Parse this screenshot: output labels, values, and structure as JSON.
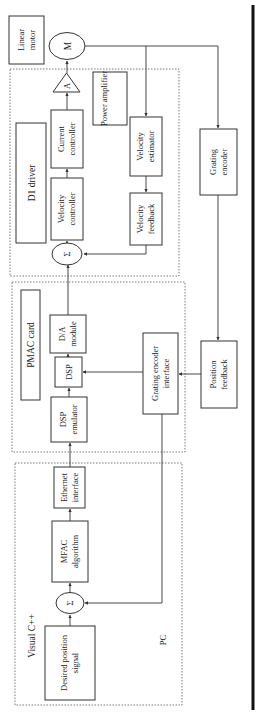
{
  "diagram": {
    "orientation": "rotated 90° counter-clockwise",
    "groups": {
      "pc": {
        "label": "PC",
        "sublabel": "Visual C++"
      },
      "pmac": {
        "label": "PMAC card"
      },
      "driver": {
        "label": "D1 driver",
        "sublabel": "Power amplifier"
      }
    },
    "blocks": {
      "desired_position": {
        "line1": "Desired position",
        "line2": "signal"
      },
      "sum_pc": {
        "symbol": "Σ"
      },
      "mfac": {
        "line1": "MFAC",
        "line2": "algorithm"
      },
      "ethernet": {
        "line1": "Ethernet",
        "line2": "interface"
      },
      "dsp_emulator": {
        "line1": "DSP",
        "line2": "emulator"
      },
      "dsp": {
        "line1": "DSP"
      },
      "da_module": {
        "line1": "D/A",
        "line2": "module"
      },
      "grating_encoder_interface": {
        "line1": "Grating encoder",
        "line2": "interface"
      },
      "sum_driver": {
        "symbol": "Σ"
      },
      "velocity_controller": {
        "line1": "Velocity",
        "line2": "controller"
      },
      "current_controller": {
        "line1": "Current",
        "line2": "controller"
      },
      "amplifier": {
        "symbol": "A"
      },
      "motor": {
        "symbol": "M"
      },
      "linear_motor": {
        "line1": "Linear",
        "line2": "motor"
      },
      "velocity_estimator": {
        "line1": "Velocity",
        "line2": "estimator"
      },
      "velocity_feedback": {
        "line1": "Velocity",
        "line2": "feedback"
      },
      "grating_encoder": {
        "line1": "Grating",
        "line2": "encoder"
      },
      "position_feedback": {
        "line1": "Position",
        "line2": "feedback"
      }
    },
    "connections": [
      [
        "desired_position",
        "sum_pc"
      ],
      [
        "sum_pc",
        "mfac"
      ],
      [
        "mfac",
        "ethernet"
      ],
      [
        "ethernet",
        "dsp_emulator"
      ],
      [
        "dsp_emulator",
        "dsp"
      ],
      [
        "dsp",
        "da_module"
      ],
      [
        "da_module",
        "sum_driver"
      ],
      [
        "sum_driver",
        "velocity_controller"
      ],
      [
        "velocity_controller",
        "current_controller"
      ],
      [
        "current_controller",
        "amplifier"
      ],
      [
        "amplifier",
        "motor"
      ],
      [
        "motor",
        "velocity_estimator"
      ],
      [
        "velocity_estimator",
        "velocity_feedback"
      ],
      [
        "velocity_feedback",
        "sum_driver"
      ],
      [
        "motor",
        "grating_encoder"
      ],
      [
        "grating_encoder",
        "position_feedback"
      ],
      [
        "position_feedback",
        "grating_encoder_interface"
      ],
      [
        "grating_encoder_interface",
        "dsp"
      ],
      [
        "grating_encoder_interface",
        "sum_pc"
      ]
    ]
  }
}
